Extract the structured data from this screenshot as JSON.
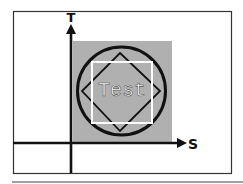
{
  "diagram": {
    "axes": {
      "x_label": "S",
      "y_label": "T"
    },
    "center_label": "Test",
    "shapes": [
      {
        "type": "frame",
        "description": "outer rectangular border"
      },
      {
        "type": "square",
        "fill": "gray",
        "description": "gray filled square in first quadrant"
      },
      {
        "type": "circle",
        "stroke": "black",
        "description": "black circle inscribed in gray square"
      },
      {
        "type": "diamond",
        "stroke": "black",
        "description": "square rotated 45 degrees inside circle"
      },
      {
        "type": "square",
        "stroke": "white",
        "description": "white axis-aligned square inside circle"
      }
    ],
    "colors": {
      "background": "#ffffff",
      "frame": "#333333",
      "gray_fill": "#b0b0b0",
      "stroke_dark": "#111111",
      "stroke_light": "#ffffff",
      "text": "#ffffff"
    }
  }
}
